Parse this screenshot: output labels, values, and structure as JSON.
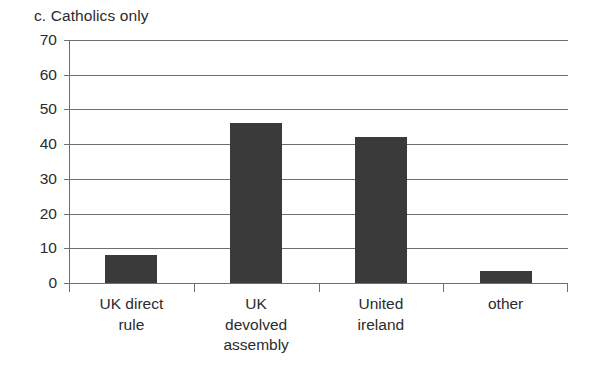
{
  "chart_data": {
    "type": "bar",
    "title": "c. Catholics only",
    "xlabel": "",
    "ylabel": "",
    "categories": [
      "UK direct rule",
      "UK devolved assembly",
      "United ireland",
      "other"
    ],
    "category_lines": [
      [
        "UK direct",
        "rule"
      ],
      [
        "UK",
        "devolved",
        "assembly"
      ],
      [
        "United",
        "ireland"
      ],
      [
        "other"
      ]
    ],
    "values": [
      8,
      46,
      42,
      3.5
    ],
    "ylim": [
      0,
      70
    ],
    "ytick_labels": [
      "0",
      "10",
      "20",
      "30",
      "40",
      "50",
      "60",
      "70"
    ],
    "ytick_values": [
      0,
      10,
      20,
      30,
      40,
      50,
      60,
      70
    ],
    "grid": "horizontal",
    "legend": "none",
    "bar_color": "#3a3a3a",
    "axis_color": "#6f6f6f",
    "background_color": "#ffffff"
  }
}
